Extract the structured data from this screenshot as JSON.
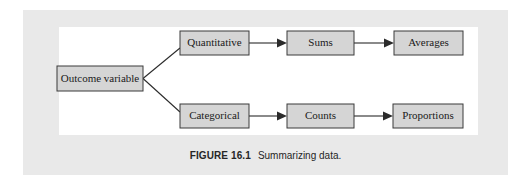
{
  "figure": {
    "caption_label": "FIGURE 16.1",
    "caption_text": "Summarizing data.",
    "colors": {
      "page_background": "#ffffff",
      "panel_background": "#e9e9e9",
      "figure_background": "#ffffff",
      "box_fill": "#d5d5d5",
      "box_border": "#3a3a3a",
      "line": "#2b2b2b",
      "text": "#1a1a1a"
    }
  },
  "diagram": {
    "type": "flowchart",
    "orientation": "left-to-right",
    "nodes": [
      {
        "id": "outcome",
        "label": "Outcome variable",
        "x": 57,
        "y": 66,
        "w": 86,
        "h": 25
      },
      {
        "id": "quantitative",
        "label": "Quantitative",
        "x": 180,
        "y": 31,
        "w": 69,
        "h": 24
      },
      {
        "id": "sums",
        "label": "Sums",
        "x": 287,
        "y": 31,
        "w": 67,
        "h": 24
      },
      {
        "id": "averages",
        "label": "Averages",
        "x": 394,
        "y": 31,
        "w": 69,
        "h": 24
      },
      {
        "id": "categorical",
        "label": "Categorical",
        "x": 180,
        "y": 104,
        "w": 69,
        "h": 24
      },
      {
        "id": "sums_lower",
        "label": "Counts",
        "x": 287,
        "y": 104,
        "w": 67,
        "h": 24
      },
      {
        "id": "proportions",
        "label": "Proportions",
        "x": 393,
        "y": 104,
        "w": 70,
        "h": 24
      }
    ],
    "edges": [
      {
        "from": "outcome",
        "to": "quantitative",
        "style": "plain-line",
        "arrow": false
      },
      {
        "from": "outcome",
        "to": "categorical",
        "style": "plain-line",
        "arrow": false
      },
      {
        "from": "quantitative",
        "to": "sums",
        "style": "arrow",
        "arrow": true
      },
      {
        "from": "sums",
        "to": "averages",
        "style": "arrow",
        "arrow": true
      },
      {
        "from": "categorical",
        "to": "sums_lower",
        "style": "arrow",
        "arrow": true
      },
      {
        "from": "sums_lower",
        "to": "proportions",
        "style": "arrow",
        "arrow": true
      }
    ]
  }
}
